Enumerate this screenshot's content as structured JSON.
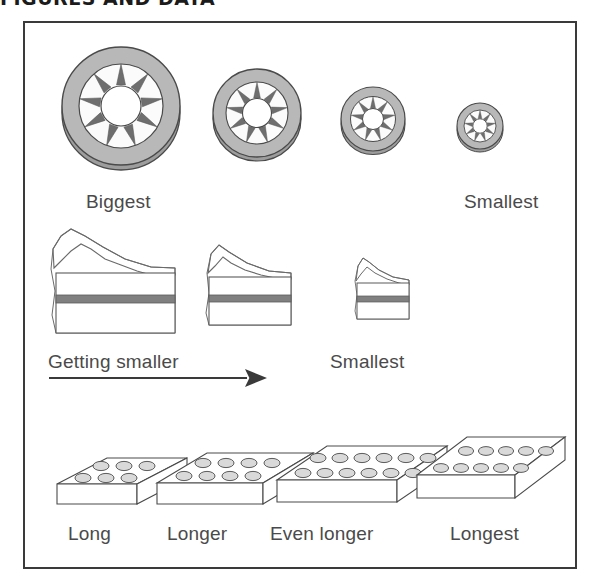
{
  "page": {
    "heading": "FIGURES AND DATA",
    "background_color": "#ffffff",
    "frame_border_color": "#3a3a3a",
    "label_color": "#4a4a4a"
  },
  "colors": {
    "tire_fill": "#b5b5b5",
    "tire_tread": "#8a8a8a",
    "spoke_fill": "#6e6e6e",
    "hub_fill": "#ffffff",
    "outline": "#4a4a4a",
    "cake_fill": "#ffffff",
    "cake_filling_stripe": "#808080",
    "brick_fill": "#ffffff",
    "stud_fill": "#d9d9d9",
    "arrow_color": "#3a3a3a"
  },
  "rows": [
    {
      "id": "wheels-row",
      "name": "wheels",
      "kind": "wheel",
      "items": [
        {
          "id": "wheel-1",
          "size_rank": 1,
          "diameter": 118,
          "spokes": 9,
          "label": "Biggest"
        },
        {
          "id": "wheel-2",
          "size_rank": 2,
          "diameter": 88,
          "spokes": 9,
          "label": ""
        },
        {
          "id": "wheel-3",
          "size_rank": 3,
          "diameter": 64,
          "spokes": 9,
          "label": ""
        },
        {
          "id": "wheel-4",
          "size_rank": 4,
          "diameter": 46,
          "spokes": 9,
          "label": "Smallest"
        }
      ],
      "labels": [
        {
          "text": "Biggest",
          "x": 84,
          "y": 185
        },
        {
          "text": "Smallest",
          "x": 462,
          "y": 185
        }
      ]
    },
    {
      "id": "cakes-row",
      "name": "cake-slices",
      "kind": "cake",
      "items": [
        {
          "id": "cake-1",
          "size_rank": 1,
          "width": 120,
          "height": 75
        },
        {
          "id": "cake-2",
          "size_rank": 2,
          "width": 90,
          "height": 62
        },
        {
          "id": "cake-3",
          "size_rank": 3,
          "width": 62,
          "height": 48
        }
      ],
      "labels": [
        {
          "text": "Getting smaller",
          "x": 46,
          "y": 345
        },
        {
          "text": "Smallest",
          "x": 328,
          "y": 345
        }
      ],
      "arrow": {
        "x1": 47,
        "y1": 377,
        "x2": 258,
        "y2": 377,
        "direction": "right"
      }
    },
    {
      "id": "bricks-row",
      "name": "bricks",
      "kind": "brick",
      "items": [
        {
          "id": "brick-1",
          "size_rank": 1,
          "studs_long": 3,
          "studs_wide": 2,
          "label": "Long"
        },
        {
          "id": "brick-2",
          "size_rank": 2,
          "studs_long": 4,
          "studs_wide": 2,
          "label": "Longer"
        },
        {
          "id": "brick-3",
          "size_rank": 3,
          "studs_long": 6,
          "studs_wide": 2,
          "label": "Even longer"
        },
        {
          "id": "brick-4",
          "size_rank": 4,
          "studs_long": 8,
          "studs_wide": 2,
          "label": "Longest"
        }
      ],
      "labels": [
        {
          "text": "Long",
          "x": 66,
          "y": 521
        },
        {
          "text": "Longer",
          "x": 165,
          "y": 521
        },
        {
          "text": "Even longer",
          "x": 268,
          "y": 521
        },
        {
          "text": "Longest",
          "x": 448,
          "y": 521
        }
      ]
    }
  ]
}
